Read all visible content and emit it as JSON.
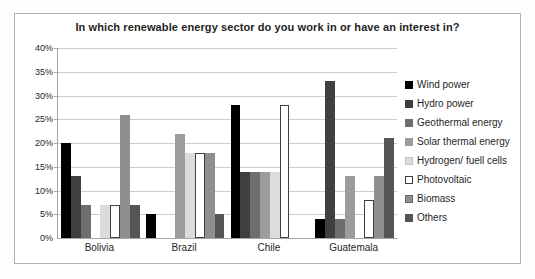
{
  "window": {
    "background": "#ffffff",
    "frame_border_color": "#b3b3b3"
  },
  "chart_data": {
    "type": "bar",
    "title": "In which renewable energy sector do you work  in or have an interest in?",
    "xlabel": "",
    "ylabel": "",
    "categories": [
      "Bolivia",
      "Brazil",
      "Chile",
      "Guatemala"
    ],
    "series": [
      {
        "name": "Wind power",
        "color": "#000000",
        "border": "",
        "values": [
          20,
          5,
          28,
          4
        ]
      },
      {
        "name": "Hydro power",
        "color": "#404040",
        "border": "",
        "values": [
          13,
          0,
          14,
          33
        ]
      },
      {
        "name": "Geothermal energy",
        "color": "#6e6e6e",
        "border": "",
        "values": [
          7,
          0,
          14,
          4
        ]
      },
      {
        "name": "Solar thermal energy",
        "color": "#9c9c9c",
        "border": "",
        "values": [
          0,
          22,
          14,
          13
        ]
      },
      {
        "name": "Hydrogen/ fuell cells",
        "color": "#dcdcdc",
        "border": "#c0c0c0",
        "values": [
          7,
          18,
          14,
          0
        ]
      },
      {
        "name": "Photovoltaic",
        "color": "#ffffff",
        "border": "#404040",
        "values": [
          7,
          18,
          28,
          8
        ]
      },
      {
        "name": "Biomass",
        "color": "#8f8f8f",
        "border": "#666666",
        "values": [
          26,
          18,
          0,
          13
        ]
      },
      {
        "name": "Others",
        "color": "#555555",
        "border": "",
        "values": [
          7,
          5,
          0,
          21
        ]
      }
    ],
    "ylim": [
      0,
      40
    ],
    "ytick_step": 5,
    "ytick_labels": [
      "0%",
      "5%",
      "10%",
      "15%",
      "20%",
      "25%",
      "30%",
      "35%",
      "40%"
    ],
    "ytick_suffix": "%",
    "grid": "horizontal",
    "gridline_color": "#cccccc",
    "legend_position": "right"
  }
}
